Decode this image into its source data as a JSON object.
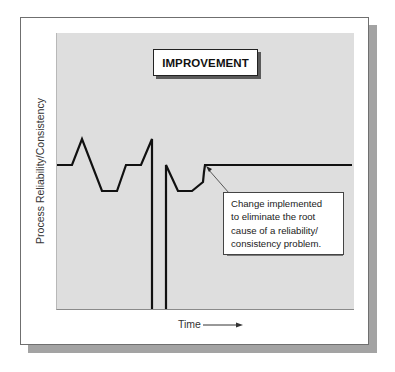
{
  "diagram": {
    "title": "IMPROVEMENT",
    "y_axis_label": "Process Reliability/Consistency",
    "x_axis_label": "Time",
    "x_axis_arrow": "right-arrow",
    "callout": {
      "lines": [
        "Change implemented",
        "to eliminate the root",
        "cause of a reliability/",
        "consistency problem."
      ],
      "points_to": "step-up point where line becomes flat"
    },
    "line_before_change": "fluctuating pattern with spikes and dips, two sharp drops to baseline",
    "line_after_change": "flat, stable line",
    "colors": {
      "plot_background": "#dedede",
      "line": "#111111",
      "frame_shadow": "#a3a3a3"
    }
  }
}
